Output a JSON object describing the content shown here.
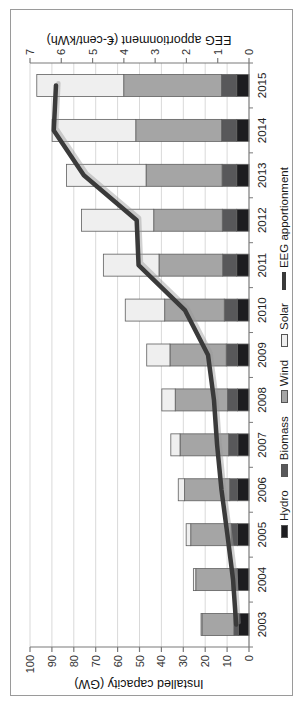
{
  "figure": {
    "orientation": "landscape chart rotated 90 degrees counter-clockwise",
    "background": "#ffffff",
    "border_color": "#9a9a9a"
  },
  "chart_data": {
    "type": "bar",
    "stacked": true,
    "grid": {
      "show": true,
      "color": "#d9d9d9"
    },
    "categories": [
      "2003",
      "2004",
      "2005",
      "2006",
      "2007",
      "2008",
      "2009",
      "2010",
      "2011",
      "2012",
      "2013",
      "2014",
      "2015"
    ],
    "series": [
      {
        "name": "Hydro",
        "color": "#1d1d20",
        "values": [
          4.9,
          5.2,
          5.2,
          5.2,
          5.1,
          5.2,
          5.3,
          5.4,
          5.6,
          5.6,
          5.6,
          5.6,
          5.6
        ]
      },
      {
        "name": "Biomass",
        "color": "#58585a",
        "values": [
          2.0,
          2.5,
          3.0,
          3.6,
          4.2,
          4.6,
          5.1,
          5.9,
          6.4,
          6.6,
          6.7,
          6.9,
          7.0
        ]
      },
      {
        "name": "Wind",
        "color": "#a5a5a5",
        "values": [
          14.6,
          16.6,
          18.4,
          20.6,
          22.2,
          23.9,
          25.7,
          27.2,
          29.1,
          31.3,
          34.7,
          39.2,
          44.6
        ]
      },
      {
        "name": "Solar",
        "color": "#efefef",
        "values": [
          0.4,
          1.1,
          2.1,
          2.9,
          4.2,
          6.1,
          10.6,
          18.0,
          25.4,
          33.0,
          36.3,
          38.2,
          39.7
        ]
      }
    ],
    "line_overlay": {
      "name": "EEG apportionment",
      "axis": "right",
      "color": "#3a3a3a",
      "values": [
        0.41,
        0.51,
        0.69,
        0.88,
        1.02,
        1.12,
        1.31,
        2.05,
        3.53,
        3.59,
        5.28,
        6.24,
        6.17
      ]
    },
    "axes": {
      "left": {
        "label": "Installed capacity (GW)",
        "min": 0,
        "max": 100,
        "tick_step": 10,
        "ticks": [
          "0",
          "10",
          "20",
          "30",
          "40",
          "50",
          "60",
          "70",
          "80",
          "90",
          "100"
        ]
      },
      "right": {
        "label": "EEG apportionment (€-cent/kWh)",
        "min": 0,
        "max": 7,
        "tick_step": 1,
        "ticks": [
          "0",
          "1",
          "2",
          "3",
          "4",
          "5",
          "6",
          "7"
        ]
      }
    },
    "legend": {
      "position": "bottom",
      "entries": [
        {
          "label": "Hydro",
          "swatch": "box",
          "color": "#1d1d20"
        },
        {
          "label": "Biomass",
          "swatch": "box",
          "color": "#58585a"
        },
        {
          "label": "Wind",
          "swatch": "box",
          "color": "#a5a5a5"
        },
        {
          "label": "Solar",
          "swatch": "box",
          "color": "#efefef"
        },
        {
          "label": "EEG apportionment",
          "swatch": "line",
          "color": "#3a3a3a"
        }
      ]
    },
    "style": {
      "axis_color": "#7a7a7a",
      "tick_label_color": "#333333",
      "bar_border_color": "#5f5f5f",
      "line_shadow_color": "#9a9a9a"
    }
  }
}
